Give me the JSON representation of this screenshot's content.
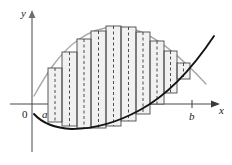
{
  "figure": {
    "background_color": "#ffffff"
  },
  "axes": {
    "x_axis": {
      "label": "x",
      "color": "#3a3a3a",
      "y_pixel": 104,
      "x_start": 32,
      "x_end": 218,
      "arrow": true
    },
    "y_axis": {
      "label": "y",
      "color": "#8c8c8c",
      "x_pixel": 32,
      "y_start": 12,
      "y_end": 152,
      "arrow": true
    },
    "origin": {
      "label": "0",
      "x": 25,
      "y": 115
    },
    "lower_limit": {
      "label": "a",
      "x": 45,
      "y": 115,
      "value_pixel": 48
    },
    "upper_limit": {
      "label": "b",
      "x": 191,
      "y": 116,
      "value_pixel": 192,
      "tick": true
    }
  },
  "curves": {
    "upper": {
      "name": "upper-curve",
      "color": "#a6a6a6",
      "stroke_width": 1.3,
      "description": "light gray concave-down curve",
      "points": [
        [
          36,
          92
        ],
        [
          44,
          78
        ],
        [
          54,
          62
        ],
        [
          66,
          48
        ],
        [
          80,
          38
        ],
        [
          96,
          30
        ],
        [
          112,
          26
        ],
        [
          126,
          27
        ],
        [
          140,
          31
        ],
        [
          152,
          38
        ],
        [
          164,
          46
        ],
        [
          176,
          56
        ],
        [
          188,
          66
        ],
        [
          196,
          74
        ],
        [
          204,
          82
        ]
      ]
    },
    "lower": {
      "name": "lower-curve",
      "color": "#1a1a1a",
      "stroke_width": 1.8,
      "description": "dark parabola-like curve rising to the right",
      "points": [
        [
          36,
          116
        ],
        [
          44,
          122
        ],
        [
          54,
          126
        ],
        [
          66,
          128
        ],
        [
          80,
          129
        ],
        [
          96,
          128
        ],
        [
          110,
          125
        ],
        [
          124,
          120
        ],
        [
          138,
          113
        ],
        [
          152,
          105
        ],
        [
          164,
          96
        ],
        [
          176,
          85
        ],
        [
          188,
          73
        ],
        [
          200,
          58
        ],
        [
          210,
          44
        ],
        [
          216,
          36
        ]
      ]
    }
  },
  "rectangles": {
    "style": {
      "fill": "#f0f0f0",
      "stroke": "#4a4a4a",
      "stroke_width": 0.9,
      "midline_stroke": "#3a3a3a",
      "midline_dash": "3,2.5"
    },
    "count": 10,
    "region_start_px": 48,
    "region_end_px": 190,
    "bars": [
      {
        "x": 48,
        "width": 14,
        "top": 68,
        "bottom": 122
      },
      {
        "x": 62,
        "width": 15,
        "top": 52,
        "bottom": 126
      },
      {
        "x": 77,
        "width": 14,
        "top": 39,
        "bottom": 128
      },
      {
        "x": 91,
        "width": 15,
        "top": 31,
        "bottom": 128
      },
      {
        "x": 106,
        "width": 15,
        "top": 26,
        "bottom": 126
      },
      {
        "x": 121,
        "width": 15,
        "top": 27,
        "bottom": 121
      },
      {
        "x": 136,
        "width": 14,
        "top": 32,
        "bottom": 114
      },
      {
        "x": 150,
        "width": 14,
        "top": 41,
        "bottom": 104
      },
      {
        "x": 164,
        "width": 13,
        "top": 51,
        "bottom": 93
      },
      {
        "x": 177,
        "width": 13,
        "top": 63,
        "bottom": 79
      }
    ]
  }
}
